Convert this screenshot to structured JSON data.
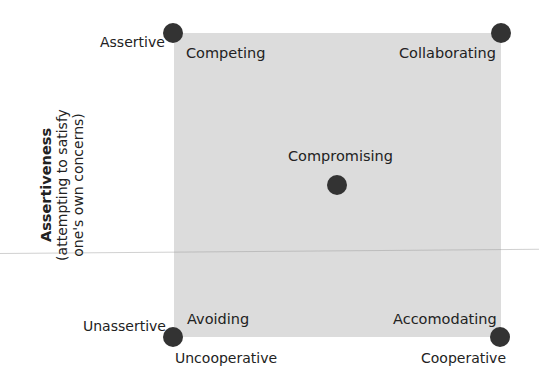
{
  "diagram": {
    "colors": {
      "square_fill": "#dcdcdc",
      "dot": "#333333",
      "text": "#222222"
    },
    "y_axis": {
      "title": "Assertiveness",
      "subtitle_line1": "(attempting to satisfy",
      "subtitle_line2": "one's own concerns)",
      "top_label": "Assertive",
      "bottom_label": "Unassertive"
    },
    "x_axis": {
      "left_label": "Uncooperative",
      "right_label": "Cooperative"
    },
    "modes": {
      "top_left": "Competing",
      "top_right": "Collaborating",
      "center": "Compromising",
      "bottom_left": "Avoiding",
      "bottom_right": "Accomodating"
    }
  }
}
